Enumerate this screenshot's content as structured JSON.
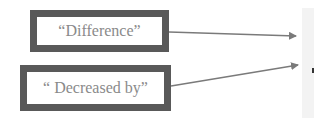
{
  "diagram": {
    "boxes": [
      {
        "id": "box-1",
        "label": "“Difference”"
      },
      {
        "id": "box-2",
        "label": "“ Decreased by”"
      }
    ],
    "arrows": [
      {
        "from": "box-1",
        "to": "right-panel"
      },
      {
        "from": "box-2",
        "to": "right-panel"
      }
    ],
    "colors": {
      "border": "#595959",
      "text": "#8a8a8a",
      "arrow": "#7a7a7a",
      "panel": "#f3f3f3"
    }
  }
}
